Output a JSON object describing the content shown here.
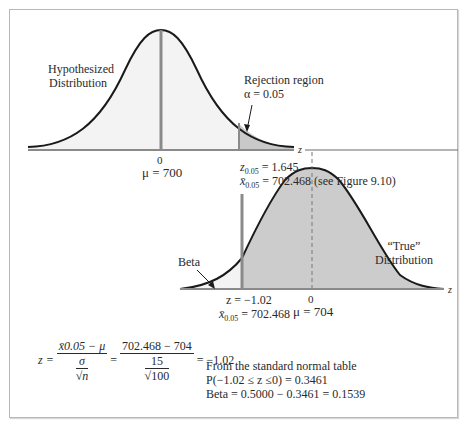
{
  "figure": {
    "hypothesized": {
      "label_line1": "Hypothesized",
      "label_line2": "Distribution",
      "zero_label": "0",
      "mu_label": "μ = 700"
    },
    "rejection": {
      "label_line1": "Rejection region",
      "alpha_label": "α = 0.05"
    },
    "critical": {
      "z_line": "z",
      "z_sub": "0.05",
      "z_value": " = 1.645",
      "x_sub": "0.05",
      "x_value": " = 702.468 (see Figure 9.10)"
    },
    "true_dist": {
      "label_line1": "“True”",
      "label_line2": "Distribution",
      "zero_label": "0",
      "mu_label": "μ = 704"
    },
    "beta_label": "Beta",
    "axis_label": "z",
    "lower": {
      "z_line": "z  = −1.02",
      "x_sub": "0.05",
      "x_value": " = 702.468"
    },
    "formula": {
      "lhs": "z = ",
      "num1": "x̄0.05 − μ",
      "den1_top": "σ",
      "den1_bottom": "√n",
      "eq": " = ",
      "num2": "702.468 − 704",
      "den2_top": "15",
      "den2_bottom": "√100",
      "result": " = −1.02"
    },
    "table_note": {
      "line1": "From the standard normal table",
      "line2": "P(−1.02 ≤ z ≤0) = 0.3461",
      "line3": "Beta = 0.5000 − 0.3461 = 0.1539"
    }
  }
}
